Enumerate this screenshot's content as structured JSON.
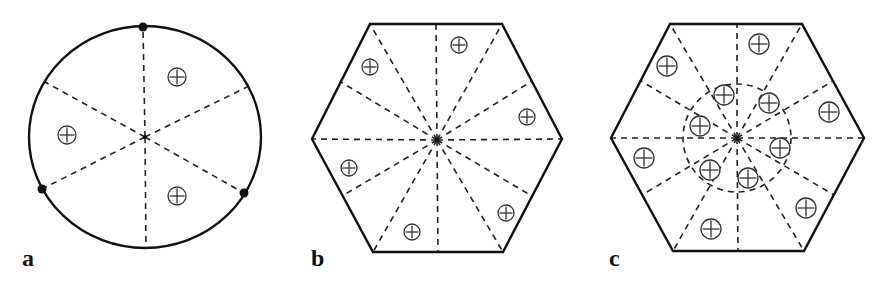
{
  "panels": [
    {
      "id": "a",
      "label": "a",
      "label_pos": [
        22,
        246
      ],
      "shape": "circle",
      "center": [
        145,
        137
      ],
      "radii": [
        116,
        111
      ],
      "boundary_points": [
        [
          143,
          27
        ],
        [
          42,
          189
        ],
        [
          244,
          193
        ]
      ],
      "spokes": [
        [
          143,
          27
        ],
        [
          146,
          248
        ],
        [
          45,
          82
        ],
        [
          42,
          189
        ],
        [
          247,
          87
        ],
        [
          244,
          193
        ]
      ],
      "plus_markers": [
        [
          177,
          77
        ],
        [
          67,
          135
        ],
        [
          177,
          196
        ]
      ],
      "plus_radius": 9
    },
    {
      "id": "b",
      "label": "b",
      "label_pos": [
        311,
        246
      ],
      "shape": "hexagon",
      "center": [
        437,
        140
      ],
      "vertices": [
        [
          370,
          24
        ],
        [
          502,
          24
        ],
        [
          562,
          139
        ],
        [
          503,
          252
        ],
        [
          373,
          252
        ],
        [
          312,
          139
        ]
      ],
      "spokes": [
        [
          370,
          24
        ],
        [
          436,
          24
        ],
        [
          502,
          24
        ],
        [
          532,
          81
        ],
        [
          562,
          139
        ],
        [
          532,
          196
        ],
        [
          503,
          252
        ],
        [
          438,
          252
        ],
        [
          373,
          252
        ],
        [
          342,
          196
        ],
        [
          312,
          139
        ],
        [
          341,
          82
        ]
      ],
      "plus_markers": [
        [
          370,
          67
        ],
        [
          459,
          45
        ],
        [
          527,
          117
        ],
        [
          349,
          168
        ],
        [
          506,
          213
        ],
        [
          412,
          232
        ]
      ],
      "plus_radius": 8
    },
    {
      "id": "c",
      "label": "c",
      "label_pos": [
        609,
        246
      ],
      "shape": "hexagon",
      "center": [
        737,
        138
      ],
      "vertices": [
        [
          670,
          24
        ],
        [
          802,
          24
        ],
        [
          864,
          138
        ],
        [
          804,
          251
        ],
        [
          673,
          251
        ],
        [
          611,
          138
        ]
      ],
      "spokes": [
        [
          670,
          24
        ],
        [
          737,
          24
        ],
        [
          802,
          24
        ],
        [
          833,
          81
        ],
        [
          864,
          138
        ],
        [
          834,
          195
        ],
        [
          804,
          251
        ],
        [
          738,
          251
        ],
        [
          673,
          251
        ],
        [
          642,
          195
        ],
        [
          611,
          138
        ],
        [
          641,
          81
        ]
      ],
      "inner_circle": {
        "center": [
          737,
          138
        ],
        "radius": 54
      },
      "plus_markers": [
        [
          759,
          44
        ],
        [
          667,
          66
        ],
        [
          829,
          112
        ],
        [
          644,
          158
        ],
        [
          806,
          208
        ],
        [
          711,
          229
        ],
        [
          724,
          95
        ],
        [
          769,
          103
        ],
        [
          700,
          126
        ],
        [
          780,
          148
        ],
        [
          710,
          170
        ],
        [
          748,
          178
        ]
      ],
      "plus_radius": 10
    }
  ],
  "style": {
    "stroke": "#111111",
    "dash_stroke": "#222222",
    "marker_stroke": "#333333"
  }
}
